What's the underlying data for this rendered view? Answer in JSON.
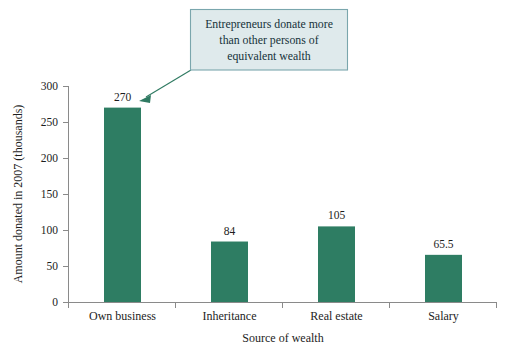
{
  "chart_data": {
    "type": "bar",
    "title": "",
    "subtitle": "",
    "categories": [
      "Own business",
      "Inheritance",
      "Real estate",
      "Salary"
    ],
    "values": [
      270,
      84,
      105,
      65.5
    ],
    "value_labels": [
      "270",
      "84",
      "105",
      "65.5"
    ],
    "xlabel": "Source of wealth",
    "ylabel": "Amount donated in 2007 (thousands)",
    "ylim": [
      0,
      300
    ],
    "ytick_step": 50,
    "ytick_labels": [
      "0",
      "50",
      "100",
      "150",
      "200",
      "250",
      "300"
    ],
    "ytick_values": [
      0,
      50,
      100,
      150,
      200,
      250,
      300
    ],
    "grid": false,
    "legend": "none",
    "series": [
      {
        "name": "Amount donated in 2007 (thousands)",
        "values": [
          270,
          84,
          105,
          65.5
        ]
      }
    ],
    "annotations": [
      {
        "text": "Entrepreneurs donate more than other persons of equivalent wealth",
        "lines": [
          "Entrepreneurs donate more",
          "than other persons of",
          "equivalent wealth"
        ],
        "points_to_category": "Own business",
        "points_to_value": 270
      }
    ]
  },
  "colors": {
    "bar": "#2e7d63",
    "bar_edge": "#2e7d63",
    "axis": "#8a8a8a",
    "text": "#1d1d1d",
    "callout_fill": "#dfeaec",
    "callout_border": "#7aa6ad",
    "callout_text": "#16323a",
    "leader": "#2f7a62",
    "background": "#ffffff"
  }
}
